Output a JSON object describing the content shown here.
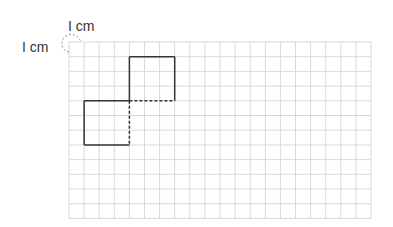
{
  "diagram": {
    "type": "grid-figure",
    "grid": {
      "columns": 20,
      "rows": 12,
      "unit": "1 cm"
    },
    "labels": {
      "horizontal_unit": "I cm",
      "vertical_unit": "I cm"
    },
    "shapes": [
      {
        "name": "upper-square",
        "col": 4,
        "row": 1,
        "width_cells": 3,
        "height_cells": 3,
        "dashed_sides": [
          "bottom"
        ]
      },
      {
        "name": "lower-square",
        "col": 1,
        "row": 4,
        "width_cells": 3,
        "height_cells": 3,
        "dashed_sides": [
          "right"
        ]
      }
    ],
    "colors": {
      "grid": "#d9d9d9",
      "outline": "#333333",
      "label": "#333333",
      "unit_arc": "#999999"
    }
  }
}
